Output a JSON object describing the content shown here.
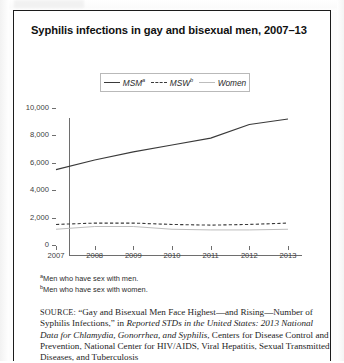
{
  "figure": {
    "title": "Syphilis infections in gay and bisexual men, 2007–13"
  },
  "legend": {
    "position": "top-center",
    "items": [
      {
        "label": "MSM",
        "note": "a",
        "style": "solid",
        "color": "#3a3a3a",
        "name": "legend-msm"
      },
      {
        "label": "MSW",
        "note": "b",
        "style": "dashed",
        "color": "#3a3a3a",
        "name": "legend-msw"
      },
      {
        "label": "Women",
        "note": "",
        "style": "solid-light",
        "color": "#bdbdbd",
        "name": "legend-women"
      }
    ]
  },
  "footnotes": [
    {
      "marker": "a",
      "text": "Men who have sex with men."
    },
    {
      "marker": "b",
      "text": "Men who have sex with women."
    }
  ],
  "source": {
    "label": "SOURCE:",
    "part1": " “Gay and Bisexual Men Face Highest—and Rising—Number of Syphilis Infections,” in ",
    "italic1": "Reported STDs in the United States: 2013 National Data for Chlamydia, Gonorrhea, and Syphilis",
    "part2": ", Centers for Disease Control and Prevention, National Center for HIV/AIDS, Viral Hepatitis, Sexual Transmitted Diseases, and Tuberculosis"
  },
  "chart_data": {
    "type": "line",
    "title": "Syphilis infections in gay and bisexual men, 2007–13",
    "xlabel": "",
    "ylabel": "",
    "x": [
      2007,
      2008,
      2009,
      2010,
      2011,
      2012,
      2013
    ],
    "categories": [
      "2007",
      "2008",
      "2009",
      "2010",
      "2011",
      "2012",
      "2013"
    ],
    "ylim": [
      0,
      10000
    ],
    "yticks": [
      0,
      2000,
      4000,
      6000,
      8000,
      10000
    ],
    "ytick_labels": [
      "0",
      "2,000",
      "4,000",
      "6,000",
      "8,000",
      "10,000"
    ],
    "grid": false,
    "legend_position": "top-center",
    "series": [
      {
        "name": "MSM",
        "note": "a",
        "style": "solid",
        "color": "#3a3a3a",
        "values": [
          5500,
          6200,
          6800,
          7300,
          7800,
          8800,
          9200
        ]
      },
      {
        "name": "MSW",
        "note": "b",
        "style": "dashed",
        "color": "#3a3a3a",
        "values": [
          1500,
          1600,
          1600,
          1500,
          1450,
          1500,
          1600
        ]
      },
      {
        "name": "Women",
        "note": "",
        "style": "solid-light",
        "color": "#bdbdbd",
        "values": [
          1150,
          1350,
          1350,
          1150,
          1100,
          1100,
          1150
        ]
      }
    ]
  }
}
